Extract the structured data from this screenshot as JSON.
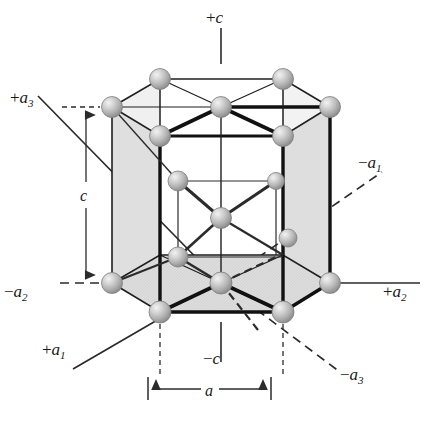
{
  "figure": {
    "type": "crystal-structure-diagram",
    "background_color": "#ffffff",
    "atom_color": "#b5b5b5",
    "atom_highlight_color": "#e8e8e8",
    "atom_outline_color": "#6e6e6e",
    "face_fill_color": "#d8d8d8",
    "edge_color": "#1f1f1f",
    "bold_edge_color": "#111111",
    "line_color": "#2b2b2b"
  },
  "labels": {
    "plus_c": {
      "op": "+",
      "var": "c",
      "sub": ""
    },
    "minus_c": {
      "op": "−",
      "var": "c",
      "sub": ""
    },
    "plus_a1": {
      "op": "+",
      "var": "a",
      "sub": "1"
    },
    "minus_a1": {
      "op": "−",
      "var": "a",
      "sub": "1"
    },
    "plus_a2": {
      "op": "+",
      "var": "a",
      "sub": "2"
    },
    "minus_a2": {
      "op": "−",
      "var": "a",
      "sub": "2"
    },
    "plus_a3": {
      "op": "+",
      "var": "a",
      "sub": "3"
    },
    "minus_a3": {
      "op": "−",
      "var": "a",
      "sub": "3"
    },
    "dim_c": {
      "var": "c"
    },
    "dim_a": {
      "var": "a"
    }
  },
  "axes": [
    {
      "name": "+c",
      "style": "solid",
      "direction": "up"
    },
    {
      "name": "-c",
      "style": "solid",
      "direction": "down"
    },
    {
      "name": "+a1",
      "style": "solid",
      "direction": "down-left"
    },
    {
      "name": "-a1",
      "style": "dashed",
      "direction": "up-right"
    },
    {
      "name": "+a2",
      "style": "solid",
      "direction": "right"
    },
    {
      "name": "-a2",
      "style": "dashed",
      "direction": "left"
    },
    {
      "name": "+a3",
      "style": "solid",
      "direction": "up-left"
    },
    {
      "name": "-a3",
      "style": "dashed",
      "direction": "down-right"
    }
  ],
  "dimensions": [
    {
      "name": "c",
      "description": "cell height, vertical double arrow on left"
    },
    {
      "name": "a",
      "description": "cell edge, horizontal double arrow at bottom"
    }
  ],
  "atoms": {
    "top_layer_count": 7,
    "mid_layer_count": 3,
    "bottom_layer_count": 7,
    "total": 17
  }
}
